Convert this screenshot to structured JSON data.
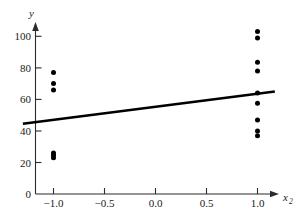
{
  "chart_data": {
    "type": "scatter",
    "title": "",
    "subtitle": "",
    "xlabel": "x_2",
    "xlabel_base": "x",
    "xlabel_subscript": "2",
    "ylabel": "y",
    "xlim": [
      -1.32,
      1.28
    ],
    "ylim": [
      0,
      108
    ],
    "xticks": [
      -1.0,
      -0.5,
      0.0,
      0.5,
      1.0
    ],
    "xticklabels": [
      "−1.0",
      "−0.5",
      "0.0",
      "0.5",
      "1.0"
    ],
    "yticks": [
      0,
      20,
      40,
      60,
      80,
      100
    ],
    "yticklabels": [
      "0",
      "20",
      "40",
      "60",
      "80",
      "100"
    ],
    "grid": false,
    "legend": null,
    "marker_color": "#000000",
    "line_color": "#000000",
    "axis_color": "#2b2b2b",
    "background_color": "#ffffff",
    "x": [
      -1.0,
      -1.0,
      -1.0,
      -1.0,
      -1.0,
      -1.0,
      1.0,
      1.0,
      1.0,
      1.0,
      1.0,
      1.0,
      1.0,
      1.0,
      1.0
    ],
    "y": [
      77.0,
      70.0,
      66.0,
      26.0,
      24.5,
      23.0,
      103.0,
      99.0,
      83.5,
      78.0,
      64.0,
      57.5,
      47.0,
      40.0,
      37.0
    ],
    "points": [
      {
        "x": -1.0,
        "y": 77.0
      },
      {
        "x": -1.0,
        "y": 70.0
      },
      {
        "x": -1.0,
        "y": 66.0
      },
      {
        "x": -1.0,
        "y": 26.0
      },
      {
        "x": -1.0,
        "y": 24.5
      },
      {
        "x": -1.0,
        "y": 23.0
      },
      {
        "x": 1.0,
        "y": 103.0
      },
      {
        "x": 1.0,
        "y": 99.0
      },
      {
        "x": 1.0,
        "y": 83.5
      },
      {
        "x": 1.0,
        "y": 78.0
      },
      {
        "x": 1.0,
        "y": 64.0
      },
      {
        "x": 1.0,
        "y": 57.5
      },
      {
        "x": 1.0,
        "y": 47.0
      },
      {
        "x": 1.0,
        "y": 40.0
      },
      {
        "x": 1.0,
        "y": 37.0
      }
    ],
    "fit_line": {
      "type": "line",
      "x_start": -1.3,
      "y_start": 44.5,
      "x_end": 1.17,
      "y_end": 65.0,
      "slope": 8.3,
      "intercept": 55.3
    }
  }
}
